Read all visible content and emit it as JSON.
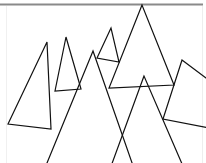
{
  "diagram": {
    "type": "overlapping-triangles",
    "frame": {
      "top_bar_color": "#8a8a8a",
      "side_line_color": "#eeeeee",
      "stroke_color": "#111111"
    },
    "triangles": [
      {
        "id": "t1",
        "points": "47,42 8,124 51,129"
      },
      {
        "id": "t2",
        "points": "66,37 55,91 81,89"
      },
      {
        "id": "t3",
        "points": "111,28 97,58 119,62"
      },
      {
        "id": "t4",
        "points": "142,5 109,88 174,85"
      },
      {
        "id": "t5",
        "points": "182,60 163,119 214,129 214,84"
      },
      {
        "id": "t6",
        "points": "93,51 40,180 138,180"
      },
      {
        "id": "t7",
        "points": "144,76 106,180 189,180"
      }
    ]
  }
}
